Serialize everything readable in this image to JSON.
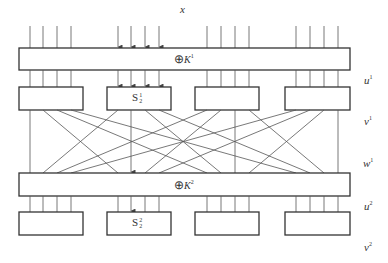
{
  "diagram": {
    "labels": {
      "input": "x",
      "u1_base": "u",
      "u1_sup": "1",
      "v1_base": "v",
      "v1_sup": "1",
      "w1_base": "w",
      "w1_sup": "1",
      "u2_base": "u",
      "u2_sup": "2",
      "v2_base": "v",
      "v2_sup": "2"
    },
    "key_mix": [
      {
        "symbol": "⊕",
        "key": "K",
        "round": "1"
      },
      {
        "symbol": "⊕",
        "key": "K",
        "round": "2"
      }
    ],
    "sboxes": {
      "round1": [
        {
          "label": "",
          "sub": ""
        },
        {
          "label": "S",
          "sup": "1",
          "sub": "2"
        },
        {
          "label": "",
          "sub": ""
        },
        {
          "label": "",
          "sub": ""
        }
      ],
      "round2": [
        {
          "label": "",
          "sub": ""
        },
        {
          "label": "S",
          "sup": "2",
          "sub": "2"
        },
        {
          "label": "",
          "sub": ""
        },
        {
          "label": "",
          "sub": ""
        }
      ]
    },
    "colors": {
      "line": "#333333",
      "thin": "#555555",
      "background": "#ffffff"
    }
  }
}
